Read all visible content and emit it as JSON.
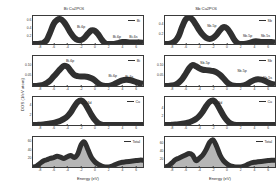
{
  "figure": {
    "axis_titles": {
      "y_global": "DOS (1/eV atom)",
      "x": "Energy (eV)"
    }
  },
  "columns": [
    {
      "id": "bi",
      "title": "Bi Cu2PO6",
      "title_html": "Bi Cu<sub>2</sub>PO<sub>6</sub>",
      "panels": [
        {
          "id": "bi-p1",
          "legend": "Bi",
          "yticks": [
            "0.2",
            "0.4",
            "0.6"
          ],
          "annotations": [
            "Bi-6p",
            "Bi-6p",
            "Bi-6s"
          ]
        },
        {
          "id": "bi-p2",
          "legend": "Bi",
          "yticks": [
            "0.05",
            "0.10"
          ],
          "annotations": [
            "Bi-6p",
            "Bi-6p",
            "Bi-6s"
          ]
        },
        {
          "id": "bi-p3",
          "legend": "Cu",
          "yticks": [
            "2",
            "4"
          ],
          "annotations": [
            "Cu-3d"
          ]
        },
        {
          "id": "bi-p4",
          "legend": "Total",
          "yticks": [
            "20",
            "40",
            "60"
          ],
          "annotations": []
        }
      ]
    },
    {
      "id": "sb",
      "title": "Sb Cu2PO6",
      "title_html": "Sb Cu<sub>2</sub>PO<sub>6</sub>",
      "panels": [
        {
          "id": "sb-p1",
          "legend": "Sb",
          "yticks": [
            "0.2",
            "0.4"
          ],
          "annotations": [
            "Sb-5p",
            "Sb-5p",
            "Sb-5s"
          ]
        },
        {
          "id": "sb-p2",
          "legend": "Sb",
          "yticks": [
            "0.05",
            "0.10"
          ],
          "annotations": [
            "Sb-5p",
            "Sb-5p",
            "Sb-5s"
          ]
        },
        {
          "id": "sb-p3",
          "legend": "Cu",
          "yticks": [
            "2",
            "4"
          ],
          "annotations": [
            "Cu-3d"
          ]
        },
        {
          "id": "sb-p4",
          "legend": "Total",
          "yticks": [
            "20",
            "40",
            "60"
          ],
          "annotations": []
        }
      ]
    }
  ],
  "xticks": [
    "-8",
    "-6",
    "-4",
    "-2",
    "0",
    "2",
    "4",
    "6"
  ],
  "chart_data": {
    "type": "line",
    "xlabel": "Energy (eV)",
    "ylabel": "DOS (1/eV atom)",
    "xlim": [
      -9,
      7
    ],
    "grid": false,
    "legend_position": "top-right inside each panel",
    "panels": [
      {
        "column": "Bi Cu2PO6",
        "row": 1,
        "series_name": "Bi",
        "ylim": [
          0,
          0.7
        ],
        "yticks": [
          0.2,
          0.4,
          0.6
        ],
        "annotations": [
          {
            "text": "Bi-6p",
            "x": -2.0,
            "y": 0.42
          },
          {
            "text": "Bi-6p",
            "x": 3.2,
            "y": 0.17
          },
          {
            "text": "Bi-6s",
            "x": 5.6,
            "y": 0.17
          }
        ],
        "x": [
          -9,
          -8.5,
          -8,
          -7.5,
          -7,
          -6.5,
          -6,
          -5.5,
          -5,
          -4.5,
          -4,
          -3.5,
          -3,
          -2.5,
          -2,
          -1.5,
          -1,
          -0.5,
          0,
          0.5,
          1,
          1.5,
          2,
          2.5,
          3,
          3.5,
          4,
          4.5,
          5,
          5.5,
          6,
          6.5,
          7
        ],
        "y": [
          0.0,
          0.0,
          0.01,
          0.03,
          0.1,
          0.29,
          0.5,
          0.6,
          0.62,
          0.55,
          0.42,
          0.27,
          0.16,
          0.1,
          0.1,
          0.16,
          0.26,
          0.34,
          0.33,
          0.24,
          0.11,
          0.02,
          0.0,
          0.0,
          0.01,
          0.03,
          0.05,
          0.05,
          0.04,
          0.04,
          0.04,
          0.04,
          0.03
        ]
      },
      {
        "column": "Bi Cu2PO6",
        "row": 2,
        "series_name": "Bi",
        "ylim": [
          0,
          0.14
        ],
        "yticks": [
          0.05,
          0.1
        ],
        "annotations": [
          {
            "text": "Bi-6p",
            "x": -3.6,
            "y": 0.115
          },
          {
            "text": "Bi-6p",
            "x": 2.6,
            "y": 0.045
          },
          {
            "text": "Bi-6s",
            "x": 5.0,
            "y": 0.04
          }
        ],
        "x": [
          -9,
          -8.5,
          -8,
          -7.5,
          -7,
          -6.5,
          -6,
          -5.5,
          -5,
          -4.5,
          -4,
          -3.5,
          -3,
          -2.5,
          -2,
          -1.5,
          -1,
          -0.5,
          0,
          0.5,
          1,
          1.5,
          2,
          2.5,
          3,
          3.5,
          4,
          4.5,
          5,
          5.5,
          6,
          6.5,
          7
        ],
        "y": [
          0.0,
          0.0,
          0.002,
          0.006,
          0.014,
          0.026,
          0.044,
          0.062,
          0.08,
          0.094,
          0.09,
          0.07,
          0.052,
          0.046,
          0.044,
          0.044,
          0.042,
          0.036,
          0.026,
          0.012,
          0.003,
          0.0,
          0.0,
          0.004,
          0.012,
          0.02,
          0.026,
          0.029,
          0.028,
          0.024,
          0.018,
          0.013,
          0.01
        ]
      },
      {
        "column": "Bi Cu2PO6",
        "row": 3,
        "series_name": "Cu",
        "ylim": [
          0,
          5.5
        ],
        "yticks": [
          2,
          4
        ],
        "annotations": [
          {
            "text": "Cu-3d",
            "x": -1.2,
            "y": 4.3
          }
        ],
        "x": [
          -9,
          -8.5,
          -8,
          -7.5,
          -7,
          -6.5,
          -6,
          -5.5,
          -5,
          -4.5,
          -4,
          -3.5,
          -3,
          -2.5,
          -2,
          -1.5,
          -1,
          -0.5,
          0,
          0.5,
          1,
          1.5,
          2,
          2.5,
          3,
          3.5,
          4,
          4.5,
          5,
          5.5,
          6,
          6.5,
          7
        ],
        "y": [
          0.0,
          0.0,
          0.05,
          0.1,
          0.18,
          0.28,
          0.42,
          0.6,
          0.85,
          1.2,
          1.7,
          2.5,
          3.6,
          4.5,
          4.8,
          4.3,
          3.2,
          2.0,
          1.0,
          0.35,
          0.08,
          0.01,
          0.0,
          0.0,
          0.0,
          0.0,
          0.0,
          0.0,
          0.0,
          0.0,
          0.0,
          0.0,
          0.0
        ]
      },
      {
        "column": "Bi Cu2PO6",
        "row": 4,
        "series_name": "Total",
        "ylim": [
          0,
          70
        ],
        "yticks": [
          20,
          40,
          60
        ],
        "annotations": [],
        "filled": true,
        "x": [
          -9,
          -8.5,
          -8,
          -7.5,
          -7,
          -6.5,
          -6,
          -5.5,
          -5,
          -4.5,
          -4,
          -3.5,
          -3,
          -2.5,
          -2,
          -1.5,
          -1,
          -0.5,
          0,
          0.5,
          1,
          1.5,
          2,
          2.5,
          3,
          3.5,
          4,
          4.5,
          5,
          5.5,
          6,
          6.5,
          7
        ],
        "y": [
          0,
          2,
          8,
          14,
          17,
          20,
          22,
          25,
          23,
          20,
          24,
          27,
          22,
          30,
          52,
          58,
          40,
          22,
          12,
          6,
          2,
          0,
          0,
          2,
          6,
          9,
          11,
          12,
          13,
          14,
          15,
          16,
          16
        ]
      },
      {
        "column": "Sb Cu2PO6",
        "row": 1,
        "series_name": "Sb",
        "ylim": [
          0,
          0.55
        ],
        "yticks": [
          0.2,
          0.4
        ],
        "annotations": [
          {
            "text": "Sb-5p",
            "x": -2.2,
            "y": 0.36
          },
          {
            "text": "Sb-5p",
            "x": 3.0,
            "y": 0.16
          },
          {
            "text": "Sb-5s",
            "x": 5.6,
            "y": 0.16
          }
        ],
        "x": [
          -9,
          -8.5,
          -8,
          -7.5,
          -7,
          -6.5,
          -6,
          -5.5,
          -5,
          -4.5,
          -4,
          -3.5,
          -3,
          -2.5,
          -2,
          -1.5,
          -1,
          -0.5,
          0,
          0.5,
          1,
          1.5,
          2,
          2.5,
          3,
          3.5,
          4,
          4.5,
          5,
          5.5,
          6,
          6.5,
          7
        ],
        "y": [
          0.0,
          0.0,
          0.02,
          0.06,
          0.16,
          0.34,
          0.48,
          0.52,
          0.48,
          0.38,
          0.27,
          0.18,
          0.12,
          0.1,
          0.12,
          0.18,
          0.27,
          0.33,
          0.31,
          0.22,
          0.1,
          0.02,
          0.0,
          0.0,
          0.01,
          0.03,
          0.05,
          0.05,
          0.04,
          0.04,
          0.04,
          0.04,
          0.03
        ]
      },
      {
        "column": "Sb Cu2PO6",
        "row": 2,
        "series_name": "Sb",
        "ylim": [
          0,
          0.14
        ],
        "yticks": [
          0.05,
          0.1
        ],
        "annotations": [
          {
            "text": "Sb-5p",
            "x": -3.2,
            "y": 0.108
          },
          {
            "text": "Sb-5p",
            "x": 2.2,
            "y": 0.072
          },
          {
            "text": "Sb-5s",
            "x": 5.9,
            "y": 0.038
          }
        ],
        "x": [
          -9,
          -8.5,
          -8,
          -7.5,
          -7,
          -6.5,
          -6,
          -5.5,
          -5,
          -4.5,
          -4,
          -3.5,
          -3,
          -2.5,
          -2,
          -1.5,
          -1,
          -0.5,
          0,
          0.5,
          1,
          1.5,
          2,
          2.5,
          3,
          3.5,
          4,
          4.5,
          5,
          5.5,
          6,
          6.5,
          7
        ],
        "y": [
          0.0,
          0.0,
          0.002,
          0.006,
          0.016,
          0.032,
          0.056,
          0.082,
          0.098,
          0.092,
          0.082,
          0.076,
          0.074,
          0.072,
          0.07,
          0.064,
          0.052,
          0.036,
          0.018,
          0.006,
          0.001,
          0.0,
          0.0,
          0.003,
          0.01,
          0.02,
          0.028,
          0.032,
          0.03,
          0.024,
          0.016,
          0.01,
          0.007
        ]
      },
      {
        "column": "Sb Cu2PO6",
        "row": 3,
        "series_name": "Cu",
        "ylim": [
          0,
          6.5
        ],
        "yticks": [
          2,
          4
        ],
        "annotations": [
          {
            "text": "Cu-3d",
            "x": -1.4,
            "y": 5.2
          }
        ],
        "x": [
          -9,
          -8.5,
          -8,
          -7.5,
          -7,
          -6.5,
          -6,
          -5.5,
          -5,
          -4.5,
          -4,
          -3.5,
          -3,
          -2.5,
          -2,
          -1.5,
          -1,
          -0.5,
          0,
          0.5,
          1,
          1.5,
          2,
          2.5,
          3,
          3.5,
          4,
          4.5,
          5,
          5.5,
          6,
          6.5,
          7
        ],
        "y": [
          0.0,
          0.0,
          0.05,
          0.1,
          0.18,
          0.28,
          0.42,
          0.62,
          0.95,
          1.4,
          2.1,
          3.1,
          4.4,
          5.4,
          5.7,
          5.0,
          3.6,
          2.2,
          1.1,
          0.4,
          0.08,
          0.01,
          0.0,
          0.0,
          0.0,
          0.0,
          0.0,
          0.0,
          0.0,
          0.0,
          0.0,
          0.0,
          0.0
        ]
      },
      {
        "column": "Sb Cu2PO6",
        "row": 4,
        "series_name": "Total",
        "ylim": [
          0,
          75
        ],
        "yticks": [
          20,
          40,
          60
        ],
        "annotations": [],
        "filled": true,
        "x": [
          -9,
          -8.5,
          -8,
          -7.5,
          -7,
          -6.5,
          -6,
          -5.5,
          -5,
          -4.5,
          -4,
          -3.5,
          -3,
          -2.5,
          -2,
          -1.5,
          -1,
          -0.5,
          0,
          0.5,
          1,
          1.5,
          2,
          2.5,
          3,
          3.5,
          4,
          4.5,
          5,
          5.5,
          6,
          6.5,
          7
        ],
        "y": [
          0,
          3,
          10,
          18,
          22,
          26,
          30,
          34,
          30,
          16,
          22,
          30,
          44,
          62,
          68,
          52,
          30,
          16,
          8,
          3,
          1,
          0,
          0,
          2,
          6,
          10,
          12,
          13,
          14,
          15,
          16,
          17,
          17
        ]
      }
    ]
  }
}
